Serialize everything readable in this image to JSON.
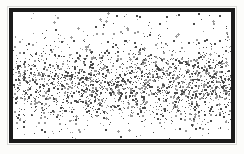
{
  "figure": {
    "kind": "stipple-density-field",
    "frame_color": "#1b1b1b",
    "frame_border_px": 4,
    "halo_color": "#dcdcda",
    "paper_color": "#fcfcfa",
    "field_background": "#ffffff",
    "dot_color": "#4a4a4a",
    "dot_color_light": "#9a9a9a",
    "caption": "",
    "labels": [],
    "tick_labels": []
  },
  "chart_data": {
    "type": "scatter",
    "title": "",
    "subtitle": "",
    "xlabel": "",
    "ylabel": "",
    "grid": false,
    "legend_position": "none",
    "xlim": [
      0,
      218
    ],
    "ylim": [
      0,
      127
    ],
    "point_count": 2300,
    "point_size_px": [
      1,
      2
    ],
    "distribution": "uniform in x, Gaussian-weighted density in y",
    "density_profile": {
      "axis": "y",
      "center": 71,
      "sigma": 20,
      "peak_relative_density": 1.0,
      "edge_relative_density": 0.04,
      "dense_core_band": [
        50,
        94
      ],
      "samples": [
        {
          "y": 2,
          "relative_density": 0.03
        },
        {
          "y": 10,
          "relative_density": 0.05
        },
        {
          "y": 20,
          "relative_density": 0.1
        },
        {
          "y": 30,
          "relative_density": 0.2
        },
        {
          "y": 40,
          "relative_density": 0.37
        },
        {
          "y": 50,
          "relative_density": 0.61
        },
        {
          "y": 60,
          "relative_density": 0.85
        },
        {
          "y": 71,
          "relative_density": 1.0
        },
        {
          "y": 82,
          "relative_density": 0.86
        },
        {
          "y": 92,
          "relative_density": 0.62
        },
        {
          "y": 102,
          "relative_density": 0.38
        },
        {
          "y": 112,
          "relative_density": 0.2
        },
        {
          "y": 120,
          "relative_density": 0.1
        },
        {
          "y": 126,
          "relative_density": 0.04
        }
      ]
    },
    "series": [
      {
        "name": "dots",
        "values": []
      }
    ]
  }
}
